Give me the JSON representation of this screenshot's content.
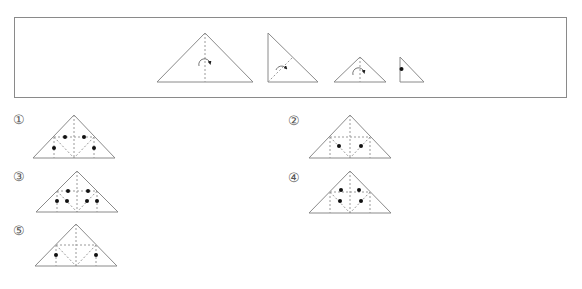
{
  "problem": {
    "folding_steps": [
      {
        "step": 1,
        "shape": "isosceles-right-triangle",
        "action": "fold along vertical center dashed line"
      },
      {
        "step": 2,
        "shape": "right-triangle",
        "action": "fold along dashed diagonal"
      },
      {
        "step": 3,
        "shape": "small-isosceles-triangle",
        "action": "fold along vertical center dashed line"
      },
      {
        "step": 4,
        "shape": "small-right-triangle",
        "action": "punch hole on left edge"
      }
    ]
  },
  "options": [
    {
      "label": "①",
      "dots": 4
    },
    {
      "label": "②",
      "dots": 2
    },
    {
      "label": "③",
      "dots": 6
    },
    {
      "label": "④",
      "dots": 4
    },
    {
      "label": "⑤",
      "dots": 2
    }
  ],
  "colors": {
    "line": "#8a8a8a",
    "dash": "#9a9a9a",
    "dot": "#111111"
  }
}
